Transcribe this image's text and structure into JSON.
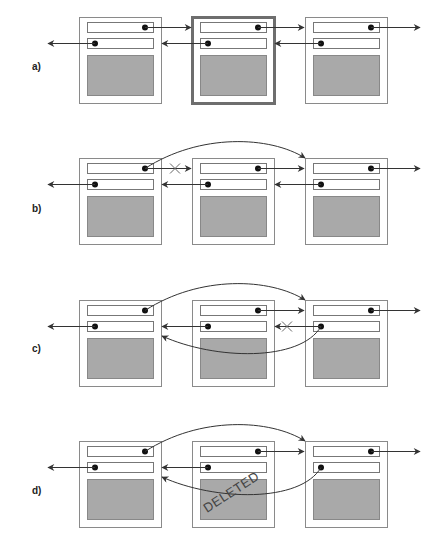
{
  "diagram": {
    "rows": [
      {
        "label": "a)",
        "step": "initial list, middle node highlighted",
        "highlight_node": 1,
        "cross": null,
        "bypass_next": false,
        "bypass_prev": false,
        "deleted_text": null
      },
      {
        "label": "b)",
        "step": "first node's next pointer redirected to third node",
        "highlight_node": null,
        "cross": "next",
        "bypass_next": true,
        "bypass_prev": false,
        "deleted_text": null
      },
      {
        "label": "c)",
        "step": "third node's prev pointer redirected to first node",
        "highlight_node": null,
        "cross": "prev",
        "bypass_next": true,
        "bypass_prev": true,
        "deleted_text": null
      },
      {
        "label": "d)",
        "step": "middle node deleted",
        "highlight_node": null,
        "cross": null,
        "bypass_next": true,
        "bypass_prev": true,
        "deleted_text": "DELETED"
      }
    ],
    "nodes_per_row": 3,
    "colors": {
      "node_border": "#8a8a8a",
      "highlight_border": "#6e6e6e",
      "data_fill": "#a9a9a9",
      "line": "#333333"
    }
  }
}
